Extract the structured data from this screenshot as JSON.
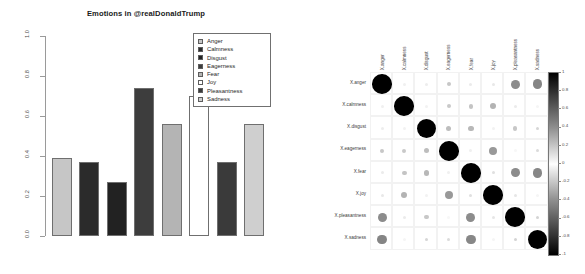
{
  "figure": {
    "panels": [
      "emotion-barplot",
      "emotion-correlation-matrix"
    ]
  },
  "barplot": {
    "title": "Emotions in @realDonaldTrump",
    "yaxis": {
      "ticks": [
        "1.0",
        "0.8",
        "0.6",
        "0.4",
        "0.2",
        "0.0"
      ]
    },
    "legend": {
      "items": [
        {
          "label": "Anger",
          "color": "#c6c6c6"
        },
        {
          "label": "Calmness",
          "color": "#2b2b2b"
        },
        {
          "label": "Disgust",
          "color": "#222222"
        },
        {
          "label": "Eagerness",
          "color": "#3d3d3d"
        },
        {
          "label": "Fear",
          "color": "#b4b4b4"
        },
        {
          "label": "Joy",
          "color": "#ffffff"
        },
        {
          "label": "Pleasantness",
          "color": "#3a3a3a"
        },
        {
          "label": "Sadness",
          "color": "#cfcfcf"
        }
      ]
    }
  },
  "chart_data": [
    {
      "type": "bar",
      "title": "Emotions in @realDonaldTrump",
      "xlabel": "",
      "ylabel": "",
      "ylim": [
        0,
        1
      ],
      "grid": false,
      "legend_position": "top-right",
      "categories": [
        "Anger",
        "Calmness",
        "Disgust",
        "Eagerness",
        "Fear",
        "Joy",
        "Pleasantness",
        "Sadness"
      ],
      "values": [
        0.39,
        0.37,
        0.27,
        0.74,
        0.56,
        0.7,
        0.37,
        0.56
      ],
      "colors": [
        "#c6c6c6",
        "#2b2b2b",
        "#222222",
        "#3d3d3d",
        "#b4b4b4",
        "#ffffff",
        "#3a3a3a",
        "#cfcfcf"
      ]
    },
    {
      "type": "heatmap",
      "title": "",
      "subtype": "correlation-matrix-circles",
      "colorbar": {
        "ticks": [
          "1",
          "0.8",
          "0.6",
          "0.4",
          "0.2",
          "0",
          "-0.2",
          "-0.4",
          "-0.6",
          "-0.8",
          "-1"
        ],
        "range": [
          -1,
          1
        ]
      },
      "rows": [
        "X.anger",
        "X.calmness",
        "X.disgust",
        "X.eagerness",
        "X.fear",
        "X.joy",
        "X.pleasantness",
        "X.sadness"
      ],
      "columns": [
        "X.anger",
        "X.calmness",
        "X.disgust",
        "X.eagerness",
        "X.fear",
        "X.joy",
        "X.pleasantness",
        "X.sadness"
      ],
      "values": [
        [
          1.0,
          0.06,
          0.07,
          0.22,
          0.08,
          0.09,
          0.45,
          0.48
        ],
        [
          0.06,
          1.0,
          0.05,
          0.21,
          0.23,
          0.3,
          0.08,
          0.04
        ],
        [
          0.07,
          0.05,
          1.0,
          0.26,
          0.28,
          0.05,
          0.22,
          0.16
        ],
        [
          0.22,
          0.21,
          0.26,
          1.0,
          0.06,
          0.4,
          0.03,
          0.14
        ],
        [
          0.08,
          0.23,
          0.28,
          0.06,
          1.0,
          0.12,
          0.45,
          0.47
        ],
        [
          0.09,
          0.3,
          0.05,
          0.4,
          0.12,
          1.0,
          0.1,
          0.04
        ],
        [
          0.45,
          0.08,
          0.22,
          0.03,
          0.45,
          0.1,
          1.0,
          0.17
        ],
        [
          0.48,
          0.04,
          0.16,
          0.14,
          0.47,
          0.04,
          0.17,
          1.0
        ]
      ]
    }
  ]
}
